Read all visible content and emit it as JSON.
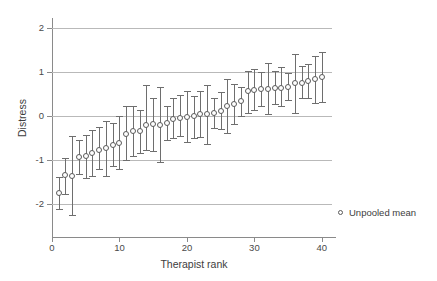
{
  "chart_data": {
    "type": "scatter",
    "title": "",
    "xlabel": "Therapist rank",
    "ylabel": "Distress",
    "xlim": [
      0,
      41.5
    ],
    "ylim": [
      -2.35,
      2.15
    ],
    "xticks": [
      0,
      10,
      20,
      30,
      40
    ],
    "yticks": [
      2,
      1,
      0,
      -1,
      -2
    ],
    "grid": "horizontal",
    "legend_position": "right-bottom-outside",
    "legend": [
      {
        "label": "Unpooled mean",
        "marker": "open-circle"
      }
    ],
    "series": [
      {
        "name": "Unpooled mean",
        "marker": "open-circle",
        "color": "#5a5a5a",
        "error_bar_color": "#6e6e6e",
        "x": [
          1,
          2,
          3,
          4,
          5,
          6,
          7,
          8,
          9,
          10,
          11,
          12,
          13,
          14,
          15,
          16,
          17,
          18,
          19,
          20,
          21,
          22,
          23,
          24,
          25,
          26,
          27,
          28,
          29,
          30,
          31,
          32,
          33,
          34,
          35,
          36,
          37,
          38,
          39,
          40
        ],
        "values": [
          -1.76,
          -1.36,
          -1.37,
          -0.93,
          -0.92,
          -0.85,
          -0.79,
          -0.73,
          -0.66,
          -0.62,
          -0.41,
          -0.35,
          -0.36,
          -0.22,
          -0.2,
          -0.21,
          -0.16,
          -0.07,
          -0.06,
          -0.03,
          -0.01,
          0.03,
          0.03,
          0.05,
          0.1,
          0.22,
          0.27,
          0.33,
          0.55,
          0.59,
          0.6,
          0.61,
          0.63,
          0.63,
          0.66,
          0.73,
          0.75,
          0.78,
          0.84,
          0.88
        ],
        "lower": [
          -2.13,
          -1.78,
          -2.26,
          -1.33,
          -1.41,
          -1.38,
          -1.21,
          -1.38,
          -1.15,
          -1.21,
          -1.02,
          -0.92,
          -0.84,
          -0.79,
          -0.81,
          -1.06,
          -0.56,
          -0.51,
          -0.46,
          -0.6,
          -0.51,
          -0.49,
          -0.64,
          -0.28,
          -0.31,
          -0.39,
          -0.19,
          -0.02,
          0.06,
          0.13,
          0.21,
          0.03,
          0.26,
          0.21,
          0.35,
          0.07,
          0.4,
          0.39,
          0.29,
          0.32
        ],
        "upper": [
          -1.4,
          -0.96,
          -0.46,
          -0.55,
          -0.44,
          -0.33,
          -0.25,
          -0.13,
          -0.16,
          -0.02,
          0.21,
          0.22,
          0.12,
          0.7,
          0.41,
          0.65,
          0.22,
          0.39,
          0.46,
          0.55,
          0.45,
          0.57,
          0.7,
          0.39,
          0.54,
          0.84,
          0.72,
          0.66,
          1.01,
          1.07,
          0.99,
          1.2,
          1.01,
          1.1,
          0.97,
          1.39,
          1.12,
          1.18,
          1.35,
          1.44
        ]
      }
    ]
  },
  "axis": {
    "y_title": "Distress",
    "x_title": "Therapist rank",
    "y_tick_labels": [
      "2",
      "1",
      "0",
      "-1",
      "-2"
    ],
    "x_tick_labels": [
      "0",
      "10",
      "20",
      "30",
      "40"
    ]
  }
}
